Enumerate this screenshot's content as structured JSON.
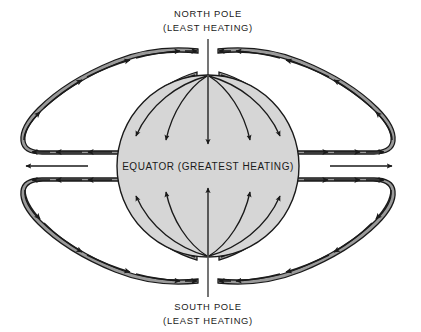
{
  "figure": {
    "title_top_line1": "NORTH POLE",
    "title_top_line2": "(LEAST HEATING)",
    "title_bottom_line1": "SOUTH POLE",
    "title_bottom_line2": "(LEAST HEATING)",
    "equator_label": "EQUATOR (GREATEST HEATING)"
  },
  "colors": {
    "background": "#ffffff",
    "globe_fill": "#d6d6d6",
    "lobe_fill": "#9a9a9a",
    "stroke": "#1a1a1a",
    "text": "#1a1a1a"
  },
  "diagram_data": {
    "type": "diagram",
    "subject": "Global atmospheric heat circulation",
    "globe": {
      "center_x": 208,
      "center_y": 166,
      "radius": 91,
      "fill": "#d6d6d6"
    },
    "pole_pointer_lines": [
      {
        "name": "north-pole-pointer",
        "x": 208,
        "y1": 40,
        "y2": 75
      },
      {
        "name": "south-pole-pointer",
        "x": 208,
        "y1": 258,
        "y2": 296
      }
    ],
    "interior_flow": {
      "description": "Curved arrows inside globe flow from each pole toward the equator",
      "north_arrow_count": 5,
      "south_arrow_count": 5,
      "direction_north": "poleward-to-equator (downward)",
      "direction_south": "poleward-to-equator (upward)"
    },
    "convection_lobes": [
      {
        "name": "upper-left-lobe",
        "flow": "clockwise",
        "fill": "#9a9a9a"
      },
      {
        "name": "upper-right-lobe",
        "flow": "counterclockwise",
        "fill": "#9a9a9a"
      },
      {
        "name": "lower-left-lobe",
        "flow": "counterclockwise",
        "fill": "#9a9a9a"
      },
      {
        "name": "lower-right-lobe",
        "flow": "clockwise",
        "fill": "#9a9a9a"
      }
    ],
    "equator_outflow": {
      "left_arrows": 3,
      "left_direction": "left",
      "right_arrows": 3,
      "right_direction": "right"
    }
  }
}
